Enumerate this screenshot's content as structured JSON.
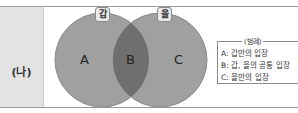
{
  "header": {
    "truncated_text": ""
  },
  "row": {
    "label": "(나)"
  },
  "venn": {
    "sets": [
      {
        "badge": "갑",
        "region_label": "A",
        "color": "#9e9e9e"
      },
      {
        "badge": "을",
        "region_label": "C",
        "color": "#9e9e9e"
      }
    ],
    "intersection": {
      "region_label": "B",
      "color": "#6e6e6e"
    }
  },
  "legend": {
    "title": "(범례)",
    "items": [
      "A: 갑만의 입장",
      "B: 갑, 을의 공통 입장",
      "C: 을만의 입장"
    ]
  }
}
